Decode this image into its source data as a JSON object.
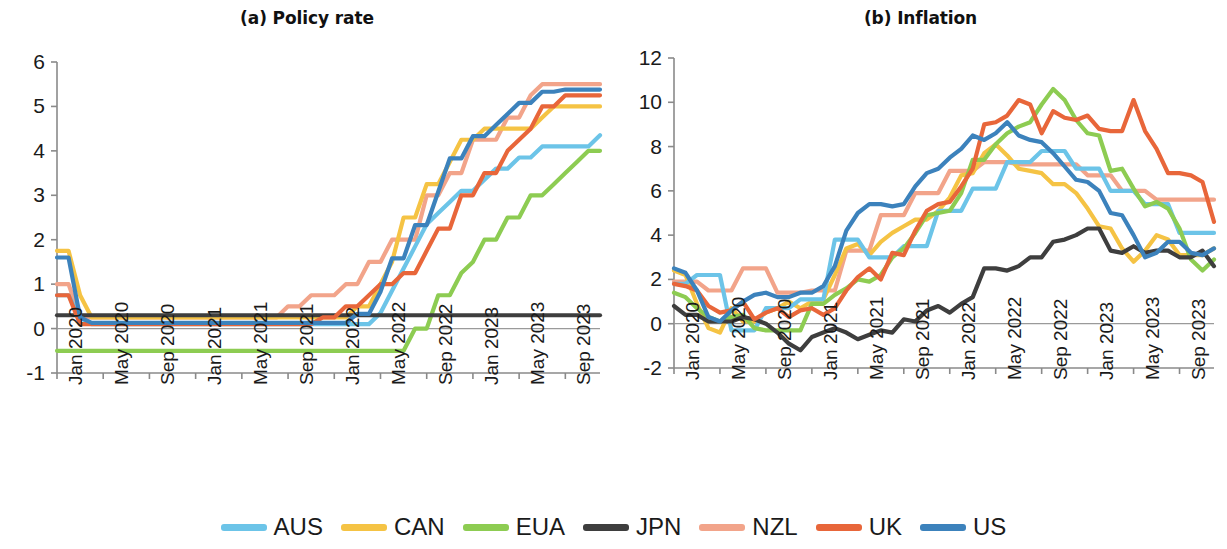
{
  "figure": {
    "width": 1227,
    "height": 549,
    "background": "#ffffff"
  },
  "legend": {
    "position": "bottom-center",
    "entries": [
      {
        "label": "AUS",
        "color": "#6CC4E8"
      },
      {
        "label": "CAN",
        "color": "#F5C344"
      },
      {
        "label": "EUA",
        "color": "#8DCC52"
      },
      {
        "label": "JPN",
        "color": "#3E3E3E"
      },
      {
        "label": "NZL",
        "color": "#F2A48A"
      },
      {
        "label": "UK",
        "color": "#E8663A"
      },
      {
        "label": "US",
        "color": "#3C82BC"
      }
    ]
  },
  "chart_data": [
    {
      "type": "line",
      "title": "(a) Policy rate",
      "xlabel": "",
      "ylabel": "",
      "ylim": [
        -1,
        6
      ],
      "yticks": [
        -1,
        0,
        1,
        2,
        3,
        4,
        5,
        6
      ],
      "ytick_labels": [
        "-1",
        "0",
        "1",
        "2",
        "3",
        "4",
        "5",
        "6"
      ],
      "grid": false,
      "zero_line": true,
      "x_start": "Jan 2020",
      "x_end": "Dec 2023",
      "x_points": 48,
      "xticks": [
        0,
        4,
        8,
        12,
        16,
        20,
        24,
        28,
        32,
        36,
        40,
        44
      ],
      "xtick_labels": [
        "Jan 2020",
        "May 2020",
        "Sep 2020",
        "Jan 2021",
        "May 2021",
        "Sep 2021",
        "Jan 2022",
        "May 2022",
        "Sep 2022",
        "Jan 2023",
        "May 2023",
        "Sep 2023"
      ],
      "series": [
        {
          "name": "AUS",
          "color": "#6CC4E8",
          "values": [
            0.75,
            0.75,
            0.25,
            0.1,
            0.1,
            0.1,
            0.1,
            0.1,
            0.1,
            0.1,
            0.1,
            0.1,
            0.1,
            0.1,
            0.1,
            0.1,
            0.1,
            0.1,
            0.1,
            0.1,
            0.1,
            0.1,
            0.1,
            0.1,
            0.1,
            0.1,
            0.1,
            0.1,
            0.35,
            0.85,
            1.35,
            1.85,
            2.35,
            2.6,
            2.85,
            3.1,
            3.1,
            3.35,
            3.6,
            3.6,
            3.85,
            3.85,
            4.1,
            4.1,
            4.1,
            4.1,
            4.1,
            4.35
          ]
        },
        {
          "name": "CAN",
          "color": "#F5C344",
          "values": [
            1.75,
            1.75,
            0.75,
            0.25,
            0.25,
            0.25,
            0.25,
            0.25,
            0.25,
            0.25,
            0.25,
            0.25,
            0.25,
            0.25,
            0.25,
            0.25,
            0.25,
            0.25,
            0.25,
            0.25,
            0.25,
            0.25,
            0.25,
            0.25,
            0.25,
            0.25,
            0.5,
            0.5,
            1.0,
            1.5,
            2.5,
            2.5,
            3.25,
            3.25,
            3.75,
            4.25,
            4.25,
            4.5,
            4.5,
            4.5,
            4.5,
            4.5,
            4.75,
            5.0,
            5.0,
            5.0,
            5.0,
            5.0
          ]
        },
        {
          "name": "EUA",
          "color": "#8DCC52",
          "values": [
            -0.5,
            -0.5,
            -0.5,
            -0.5,
            -0.5,
            -0.5,
            -0.5,
            -0.5,
            -0.5,
            -0.5,
            -0.5,
            -0.5,
            -0.5,
            -0.5,
            -0.5,
            -0.5,
            -0.5,
            -0.5,
            -0.5,
            -0.5,
            -0.5,
            -0.5,
            -0.5,
            -0.5,
            -0.5,
            -0.5,
            -0.5,
            -0.5,
            -0.5,
            -0.5,
            -0.5,
            0.0,
            0.0,
            0.75,
            0.75,
            1.25,
            1.5,
            2.0,
            2.0,
            2.5,
            2.5,
            3.0,
            3.0,
            3.25,
            3.5,
            3.75,
            4.0,
            4.0
          ]
        },
        {
          "name": "JPN",
          "color": "#3E3E3E",
          "values": [
            0.3,
            0.3,
            0.3,
            0.3,
            0.3,
            0.3,
            0.3,
            0.3,
            0.3,
            0.3,
            0.3,
            0.3,
            0.3,
            0.3,
            0.3,
            0.3,
            0.3,
            0.3,
            0.3,
            0.3,
            0.3,
            0.3,
            0.3,
            0.3,
            0.3,
            0.3,
            0.3,
            0.3,
            0.3,
            0.3,
            0.3,
            0.3,
            0.3,
            0.3,
            0.3,
            0.3,
            0.3,
            0.3,
            0.3,
            0.3,
            0.3,
            0.3,
            0.3,
            0.3,
            0.3,
            0.3,
            0.3,
            0.3
          ]
        },
        {
          "name": "NZL",
          "color": "#F2A48A",
          "values": [
            1.0,
            1.0,
            0.25,
            0.25,
            0.25,
            0.25,
            0.25,
            0.25,
            0.25,
            0.25,
            0.25,
            0.25,
            0.25,
            0.25,
            0.25,
            0.25,
            0.25,
            0.25,
            0.25,
            0.25,
            0.5,
            0.5,
            0.75,
            0.75,
            0.75,
            1.0,
            1.0,
            1.5,
            1.5,
            2.0,
            2.0,
            2.0,
            3.0,
            3.0,
            3.5,
            3.5,
            4.25,
            4.25,
            4.25,
            4.75,
            4.75,
            5.25,
            5.5,
            5.5,
            5.5,
            5.5,
            5.5,
            5.5
          ]
        },
        {
          "name": "UK",
          "color": "#E8663A",
          "values": [
            0.75,
            0.75,
            0.1,
            0.1,
            0.1,
            0.1,
            0.1,
            0.1,
            0.1,
            0.1,
            0.1,
            0.1,
            0.1,
            0.1,
            0.1,
            0.1,
            0.1,
            0.1,
            0.1,
            0.1,
            0.1,
            0.1,
            0.1,
            0.25,
            0.25,
            0.5,
            0.5,
            0.75,
            1.0,
            1.0,
            1.25,
            1.25,
            1.75,
            2.25,
            2.25,
            3.0,
            3.0,
            3.5,
            3.5,
            4.0,
            4.25,
            4.5,
            5.0,
            5.0,
            5.25,
            5.25,
            5.25,
            5.25
          ]
        },
        {
          "name": "US",
          "color": "#3C82BC",
          "values": [
            1.6,
            1.6,
            0.25,
            0.13,
            0.13,
            0.13,
            0.13,
            0.13,
            0.13,
            0.13,
            0.13,
            0.13,
            0.13,
            0.13,
            0.13,
            0.13,
            0.13,
            0.13,
            0.13,
            0.13,
            0.13,
            0.13,
            0.13,
            0.13,
            0.13,
            0.13,
            0.33,
            0.33,
            0.83,
            1.58,
            1.58,
            2.33,
            2.33,
            3.08,
            3.83,
            3.83,
            4.33,
            4.33,
            4.58,
            4.83,
            5.08,
            5.08,
            5.33,
            5.33,
            5.38,
            5.38,
            5.38,
            5.38
          ]
        }
      ]
    },
    {
      "type": "line",
      "title": "(b) Inflation",
      "xlabel": "",
      "ylabel": "",
      "ylim": [
        -2,
        12
      ],
      "yticks": [
        -2,
        0,
        2,
        4,
        6,
        8,
        10,
        12
      ],
      "ytick_labels": [
        "-2",
        "0",
        "2",
        "4",
        "6",
        "8",
        "10",
        "12"
      ],
      "grid": false,
      "zero_line": true,
      "x_start": "Jan 2020",
      "x_end": "Dec 2023",
      "x_points": 48,
      "xticks": [
        0,
        4,
        8,
        12,
        16,
        20,
        24,
        28,
        32,
        36,
        40,
        44
      ],
      "xtick_labels": [
        "Jan 2020",
        "May 2020",
        "Sep 2020",
        "Jan 2021",
        "May 2021",
        "Sep 2021",
        "Jan 2022",
        "May 2022",
        "Sep 2022",
        "Jan 2023",
        "May 2023",
        "Sep 2023"
      ],
      "series": [
        {
          "name": "AUS",
          "color": "#6CC4E8",
          "values": [
            1.8,
            1.8,
            2.2,
            2.2,
            2.2,
            -0.3,
            -0.3,
            -0.3,
            0.7,
            0.7,
            0.7,
            1.1,
            1.1,
            1.1,
            3.8,
            3.8,
            3.8,
            3.0,
            3.0,
            3.0,
            3.5,
            3.5,
            3.5,
            5.1,
            5.1,
            5.1,
            6.1,
            6.1,
            6.1,
            7.3,
            7.3,
            7.3,
            7.8,
            7.8,
            7.8,
            7.0,
            7.0,
            7.0,
            6.0,
            6.0,
            6.0,
            5.4,
            5.4,
            5.4,
            4.1,
            4.1,
            4.1,
            4.1
          ]
        },
        {
          "name": "CAN",
          "color": "#F5C344",
          "values": [
            2.4,
            2.2,
            0.9,
            -0.2,
            -0.4,
            0.7,
            0.1,
            0.1,
            0.5,
            0.7,
            1.0,
            0.7,
            1.0,
            1.1,
            2.2,
            3.4,
            3.6,
            3.1,
            3.7,
            4.1,
            4.4,
            4.7,
            4.7,
            5.1,
            5.7,
            6.7,
            6.8,
            7.7,
            8.1,
            7.6,
            7.0,
            6.9,
            6.8,
            6.3,
            6.3,
            5.9,
            5.2,
            4.4,
            4.3,
            3.4,
            2.8,
            3.3,
            4.0,
            3.8,
            3.1,
            3.1,
            3.1,
            3.4
          ]
        },
        {
          "name": "EUA",
          "color": "#8DCC52",
          "values": [
            1.4,
            1.2,
            0.7,
            0.3,
            0.1,
            0.3,
            0.4,
            -0.2,
            -0.3,
            -0.3,
            -0.3,
            -0.3,
            0.9,
            0.9,
            1.3,
            1.6,
            2.0,
            1.9,
            2.2,
            3.0,
            3.4,
            4.1,
            4.9,
            5.0,
            5.1,
            5.9,
            7.4,
            7.4,
            8.1,
            8.6,
            8.9,
            9.1,
            9.9,
            10.6,
            10.1,
            9.2,
            8.6,
            8.5,
            6.9,
            7.0,
            6.1,
            5.3,
            5.5,
            5.2,
            4.3,
            2.9,
            2.4,
            2.9
          ]
        },
        {
          "name": "JPN",
          "color": "#3E3E3E",
          "values": [
            0.8,
            0.4,
            0.4,
            0.1,
            0.1,
            0.1,
            0.3,
            0.2,
            0.0,
            -0.4,
            -0.9,
            -1.2,
            -0.6,
            -0.4,
            -0.2,
            -0.4,
            -0.7,
            -0.5,
            -0.3,
            -0.4,
            0.2,
            0.1,
            0.6,
            0.8,
            0.5,
            0.9,
            1.2,
            2.5,
            2.5,
            2.4,
            2.6,
            3.0,
            3.0,
            3.7,
            3.8,
            4.0,
            4.3,
            4.3,
            3.3,
            3.2,
            3.5,
            3.2,
            3.3,
            3.3,
            3.0,
            3.0,
            3.3,
            2.6
          ]
        },
        {
          "name": "NZL",
          "color": "#F2A48A",
          "values": [
            1.9,
            1.9,
            1.9,
            1.5,
            1.5,
            1.5,
            2.5,
            2.5,
            2.5,
            1.4,
            1.4,
            1.4,
            1.5,
            1.5,
            1.5,
            3.3,
            3.3,
            3.3,
            4.9,
            4.9,
            4.9,
            5.9,
            5.9,
            5.9,
            6.9,
            6.9,
            6.9,
            7.3,
            7.3,
            7.3,
            7.2,
            7.2,
            7.2,
            7.2,
            7.2,
            7.2,
            6.7,
            6.7,
            6.7,
            6.0,
            6.0,
            6.0,
            5.6,
            5.6,
            5.6,
            5.6,
            5.6,
            5.6
          ]
        },
        {
          "name": "UK",
          "color": "#E8663A",
          "values": [
            1.8,
            1.7,
            1.5,
            0.8,
            0.5,
            0.6,
            1.0,
            0.2,
            0.5,
            0.7,
            0.3,
            0.6,
            0.7,
            0.4,
            0.7,
            1.5,
            2.1,
            2.5,
            2.0,
            3.2,
            3.1,
            4.2,
            5.1,
            5.4,
            5.5,
            6.2,
            7.0,
            9.0,
            9.1,
            9.4,
            10.1,
            9.9,
            8.6,
            9.6,
            9.3,
            9.2,
            9.4,
            8.8,
            8.7,
            8.7,
            10.1,
            8.7,
            7.9,
            6.8,
            6.8,
            6.7,
            6.4,
            4.6
          ]
        },
        {
          "name": "US",
          "color": "#3C82BC",
          "values": [
            2.5,
            2.3,
            1.5,
            0.3,
            0.1,
            0.6,
            1.0,
            1.3,
            1.4,
            1.2,
            1.2,
            1.4,
            1.4,
            1.7,
            2.6,
            4.2,
            5.0,
            5.4,
            5.4,
            5.3,
            5.4,
            6.2,
            6.8,
            7.0,
            7.5,
            7.9,
            8.5,
            8.3,
            8.6,
            9.1,
            8.5,
            8.3,
            8.2,
            7.7,
            7.1,
            6.5,
            6.4,
            6.0,
            5.0,
            4.9,
            4.0,
            3.0,
            3.2,
            3.7,
            3.7,
            3.2,
            3.1,
            3.4
          ]
        }
      ]
    }
  ]
}
